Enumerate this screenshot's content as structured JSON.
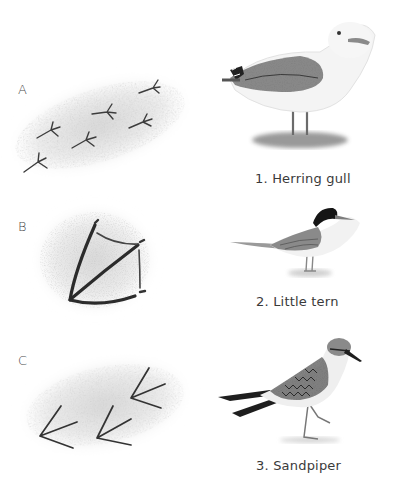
{
  "tracks": [
    {
      "letter": "A",
      "description": "small three-toed tracks in a scattered pattern"
    },
    {
      "letter": "B",
      "description": "single large webbed footprint"
    },
    {
      "letter": "C",
      "description": "three-toed tracks, medium size"
    }
  ],
  "birds": [
    {
      "number": 1,
      "label": "1. Herring gull"
    },
    {
      "number": 2,
      "label": "2. Little tern"
    },
    {
      "number": 3,
      "label": "3. Sandpiper"
    }
  ],
  "colors": {
    "ink": "#3a3a3a",
    "sand": "#d9d9d9",
    "wing": "#6e6e6e",
    "dark": "#1e1e1e"
  }
}
